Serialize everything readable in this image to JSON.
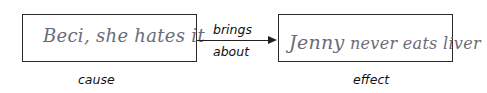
{
  "diagram": {
    "cause": {
      "box_text": "Beci, she hates it",
      "label": "cause"
    },
    "connector": {
      "label_line1": "brings",
      "label_line2": "about",
      "direction": "left-to-right"
    },
    "effect": {
      "box_text_name": "Jenny",
      "box_text_rest": "never eats liver",
      "label": "effect"
    },
    "colors": {
      "border": "#2a2a2a",
      "handwriting": "#6b6b78",
      "label": "#111111"
    }
  }
}
